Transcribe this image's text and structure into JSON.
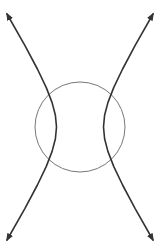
{
  "diagram": {
    "type": "conic-sections",
    "colors": {
      "background": "#ffffff",
      "hyperbola": "#333333",
      "circle": "#777777"
    },
    "circle": {
      "cx": 80,
      "cy": 127,
      "r": 45
    },
    "hyperbola": {
      "cx": 80,
      "cy": 127,
      "a": 23.5,
      "b": 38.4,
      "orientation": "horizontal",
      "branches": [
        {
          "name": "left-branch",
          "path": "M7,14 L24.7,45.2 L37.4,69 L46.3,87.6 L52.1,102.6 L55.4,115.3 L56.5,127 L55.4,138.7 L52.1,151.4 L46.3,166.4 L37.4,185 L24.7,208.8 L7,240"
        },
        {
          "name": "right-branch",
          "path": "M153,14 L135.3,45.2 L122.6,69 L113.7,87.6 L107.9,102.6 L104.6,115.3 L103.5,127 L104.6,138.7 L107.9,151.4 L113.7,166.4 L122.6,185 L135.3,208.8 L153,240"
        }
      ],
      "arrowheads": [
        "top-left",
        "top-right",
        "bottom-left",
        "bottom-right"
      ]
    }
  }
}
